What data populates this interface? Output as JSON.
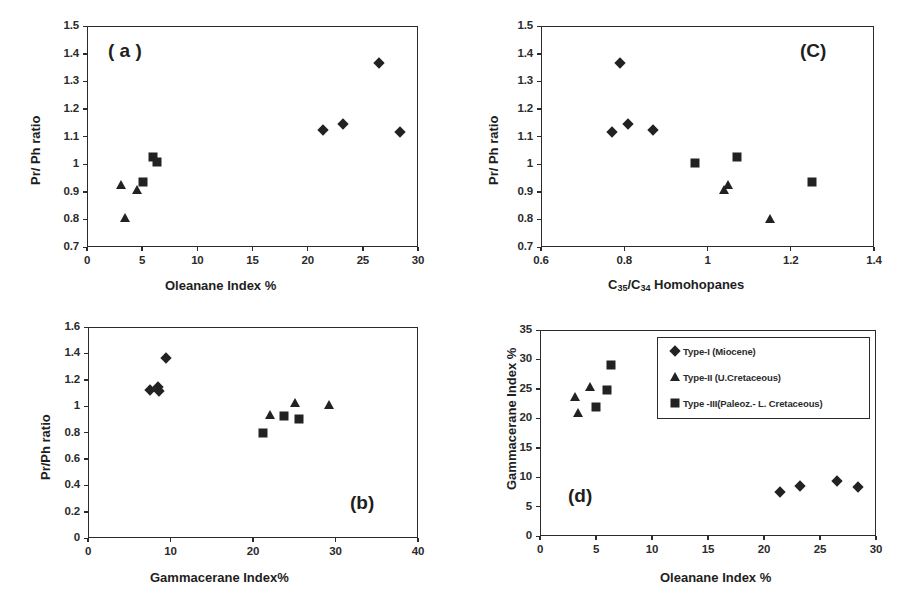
{
  "figure": {
    "background": "#ffffff",
    "marker_color": "#222222",
    "axis_color": "#2b2b2b"
  },
  "legend": {
    "position": "panel-d-top-right",
    "items": [
      {
        "marker": "diamond",
        "label": "Type-I (Miocene)"
      },
      {
        "marker": "triangle",
        "label": "Type-II (U.Cretaceous)"
      },
      {
        "marker": "square",
        "label": "Type -III(Paleoz.- L. Cretaceous)"
      }
    ]
  },
  "chart_data": [
    {
      "id": "panel-a",
      "type": "scatter",
      "tag": "( a )",
      "title": "",
      "xlabel": "Oleanane Index %",
      "ylabel": "Pr/ Ph ratio",
      "xlim": [
        0,
        30
      ],
      "ylim": [
        0.7,
        1.5
      ],
      "xticks": [
        0,
        5,
        10,
        15,
        20,
        25,
        30
      ],
      "xticklabels": [
        "0",
        "5",
        "10",
        "15",
        "20",
        "25",
        "30"
      ],
      "yticks": [
        0.7,
        0.8,
        0.9,
        1.0,
        1.1,
        1.2,
        1.3,
        1.4,
        1.5
      ],
      "yticklabels": [
        "0.7",
        "0.8",
        "0.9",
        "1",
        "1.1",
        "1.2",
        "1.3",
        "1.4",
        "1.5"
      ],
      "grid": false,
      "series": [
        {
          "name": "Type-I (Miocene)",
          "marker": "diamond",
          "points": [
            {
              "x": 21.4,
              "y": 1.125
            },
            {
              "x": 23.2,
              "y": 1.145
            },
            {
              "x": 26.5,
              "y": 1.365
            },
            {
              "x": 28.4,
              "y": 1.115
            }
          ]
        },
        {
          "name": "Type-II (U.Cretaceous)",
          "marker": "triangle",
          "points": [
            {
              "x": 3.1,
              "y": 0.925
            },
            {
              "x": 3.4,
              "y": 0.805
            },
            {
              "x": 4.5,
              "y": 0.908
            }
          ]
        },
        {
          "name": "Type -III(Paleoz.- L. Cretaceous)",
          "marker": "square",
          "points": [
            {
              "x": 5.1,
              "y": 0.935
            },
            {
              "x": 6.0,
              "y": 1.025
            },
            {
              "x": 6.3,
              "y": 1.008
            }
          ]
        }
      ]
    },
    {
      "id": "panel-c",
      "type": "scatter",
      "tag": "(C)",
      "title": "",
      "xlabel": "C35/C34 Homohopanes",
      "xlabel_parts": {
        "pre": "C",
        "sub1": "35",
        "mid": "/C",
        "sub2": "34",
        "post": " Homohopanes"
      },
      "ylabel": "Pr/ Ph ratio",
      "xlim": [
        0.6,
        1.4
      ],
      "ylim": [
        0.7,
        1.5
      ],
      "xticks": [
        0.6,
        0.8,
        1.0,
        1.2,
        1.4
      ],
      "xticklabels": [
        "0.6",
        "0.8",
        "1",
        "1.2",
        "1.4"
      ],
      "yticks": [
        0.7,
        0.8,
        0.9,
        1.0,
        1.1,
        1.2,
        1.3,
        1.4,
        1.5
      ],
      "yticklabels": [
        "0.7",
        "0.8",
        "0.9",
        "1",
        "1.1",
        "1.2",
        "1.3",
        "1.4",
        "1.5"
      ],
      "grid": false,
      "series": [
        {
          "name": "Type-I (Miocene)",
          "marker": "diamond",
          "points": [
            {
              "x": 0.77,
              "y": 1.118
            },
            {
              "x": 0.79,
              "y": 1.365
            },
            {
              "x": 0.81,
              "y": 1.145
            },
            {
              "x": 0.87,
              "y": 1.125
            }
          ]
        },
        {
          "name": "Type-II (U.Cretaceous)",
          "marker": "triangle",
          "points": [
            {
              "x": 1.04,
              "y": 0.908
            },
            {
              "x": 1.05,
              "y": 0.925
            },
            {
              "x": 1.15,
              "y": 0.803
            }
          ]
        },
        {
          "name": "Type -III(Paleoz.- L. Cretaceous)",
          "marker": "square",
          "points": [
            {
              "x": 0.97,
              "y": 1.005
            },
            {
              "x": 1.07,
              "y": 1.025
            },
            {
              "x": 1.25,
              "y": 0.935
            }
          ]
        }
      ]
    },
    {
      "id": "panel-b",
      "type": "scatter",
      "tag": "(b)",
      "title": "",
      "xlabel": "Gammacerane Index%",
      "ylabel": "Pr/Ph ratio",
      "xlim": [
        0,
        40
      ],
      "ylim": [
        0,
        1.6
      ],
      "xticks": [
        0,
        10,
        20,
        30,
        40
      ],
      "xticklabels": [
        "0",
        "10",
        "20",
        "30",
        "40"
      ],
      "yticks": [
        0,
        0.2,
        0.4,
        0.6,
        0.8,
        1.0,
        1.2,
        1.4,
        1.6
      ],
      "yticklabels": [
        "0",
        "0.2",
        "0.4",
        "0.6",
        "0.8",
        "1",
        "1.2",
        "1.4",
        "1.6"
      ],
      "grid": false,
      "series": [
        {
          "name": "Type-I (Miocene)",
          "marker": "diamond",
          "points": [
            {
              "x": 7.5,
              "y": 1.125
            },
            {
              "x": 8.5,
              "y": 1.145
            },
            {
              "x": 8.6,
              "y": 1.118
            },
            {
              "x": 9.4,
              "y": 1.365
            }
          ]
        },
        {
          "name": "Type-II (U.Cretaceous)",
          "marker": "triangle",
          "points": [
            {
              "x": 22.0,
              "y": 0.935
            },
            {
              "x": 25.1,
              "y": 1.025
            },
            {
              "x": 29.2,
              "y": 1.005
            }
          ]
        },
        {
          "name": "Type -III(Paleoz.- L. Cretaceous)",
          "marker": "square",
          "points": [
            {
              "x": 21.2,
              "y": 0.8
            },
            {
              "x": 23.8,
              "y": 0.925
            },
            {
              "x": 25.6,
              "y": 0.902
            }
          ]
        }
      ]
    },
    {
      "id": "panel-d",
      "type": "scatter",
      "tag": "(d)",
      "title": "",
      "xlabel": "Oleanane Index %",
      "ylabel": "Gammacerane Index %",
      "xlim": [
        0,
        30
      ],
      "ylim": [
        0,
        35
      ],
      "xticks": [
        0,
        5,
        10,
        15,
        20,
        25,
        30
      ],
      "xticklabels": [
        "0",
        "5",
        "10",
        "15",
        "20",
        "25",
        "30"
      ],
      "yticks": [
        0,
        5,
        10,
        15,
        20,
        25,
        30,
        35
      ],
      "yticklabels": [
        "0",
        "5",
        "10",
        "15",
        "20",
        "25",
        "30",
        "35"
      ],
      "grid": false,
      "series": [
        {
          "name": "Type-I (Miocene)",
          "marker": "diamond",
          "points": [
            {
              "x": 21.4,
              "y": 7.5
            },
            {
              "x": 23.2,
              "y": 8.5
            },
            {
              "x": 26.5,
              "y": 9.3
            },
            {
              "x": 28.4,
              "y": 8.3
            }
          ]
        },
        {
          "name": "Type-II (U.Cretaceous)",
          "marker": "triangle",
          "points": [
            {
              "x": 3.1,
              "y": 23.6
            },
            {
              "x": 3.4,
              "y": 20.9
            },
            {
              "x": 4.5,
              "y": 25.3
            }
          ]
        },
        {
          "name": "Type -III(Paleoz.- L. Cretaceous)",
          "marker": "square",
          "points": [
            {
              "x": 5.0,
              "y": 21.9
            },
            {
              "x": 6.0,
              "y": 24.8
            },
            {
              "x": 6.3,
              "y": 29.0
            }
          ]
        }
      ]
    }
  ]
}
